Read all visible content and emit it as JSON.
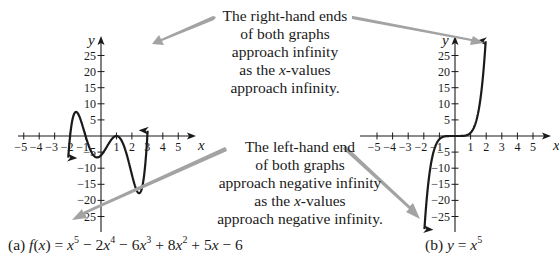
{
  "annotations": {
    "top": {
      "lines": [
        "The right-hand ends",
        "of both graphs",
        "approach infinity",
        "as the |x|-values",
        "approach infinity."
      ]
    },
    "bottom": {
      "lines": [
        "The left-hand end",
        "of both graphs",
        "approach negative infinity",
        "as the |x|-values",
        "approach negative infinity."
      ]
    }
  },
  "captions": {
    "a": {
      "label": "(a)",
      "func": "f(x) = x^5 − 2x^4 − 6x^3 + 8x^2 + 5x − 6"
    },
    "b": {
      "label": "(b)",
      "func": "y = x^5"
    }
  },
  "colors": {
    "curve": "#1a1a1a",
    "axis": "#1a1a1a",
    "arrow": "#a0a0a0",
    "text": "#1a1a1a"
  },
  "graphs": [
    {
      "id": "a",
      "x_label": "x",
      "y_label": "y",
      "x_ticks": [
        -5,
        -4,
        -3,
        -2,
        -1,
        1,
        2,
        3,
        4,
        5
      ],
      "y_ticks": [
        25,
        20,
        15,
        10,
        5,
        -5,
        -10,
        -15,
        -20,
        -25
      ],
      "coefficients": [
        1,
        -2,
        -6,
        8,
        5,
        -6
      ],
      "x_domain": [
        -2.12,
        3.02
      ],
      "y_clip": [
        -29,
        30.5
      ]
    },
    {
      "id": "b",
      "x_label": "x",
      "y_label": "y",
      "x_ticks": [
        -5,
        -4,
        -3,
        -2,
        -1,
        1,
        2,
        3,
        4,
        5
      ],
      "y_ticks": [
        25,
        20,
        15,
        10,
        5,
        -5,
        -10,
        -15,
        -20,
        -25
      ],
      "coefficients": [
        1,
        0,
        0,
        0,
        0,
        0
      ],
      "x_domain": [
        -2.0,
        2.0
      ],
      "y_clip": [
        -29,
        29.5
      ]
    }
  ],
  "chart_data": [
    {
      "type": "line",
      "title": "(a) f(x) = x^5 − 2x^4 − 6x^3 + 8x^2 + 5x − 6",
      "xlabel": "x",
      "ylabel": "y",
      "xlim": [
        -5,
        5
      ],
      "ylim": [
        -25,
        25
      ],
      "x_ticks": [
        -5,
        -4,
        -3,
        -2,
        -1,
        1,
        2,
        3,
        4,
        5
      ],
      "y_ticks": [
        -25,
        -20,
        -15,
        -10,
        -5,
        5,
        10,
        15,
        20,
        25
      ],
      "key_points": [
        {
          "x": -2,
          "y": 0
        },
        {
          "x": -1.6,
          "y": 7.2
        },
        {
          "x": -1,
          "y": 0
        },
        {
          "x": -0.25,
          "y": -6.6
        },
        {
          "x": 1,
          "y": 0
        },
        {
          "x": 2.5,
          "y": -17.6
        },
        {
          "x": 3,
          "y": 0
        }
      ],
      "end_behavior": {
        "left": "-infinity",
        "right": "+infinity"
      }
    },
    {
      "type": "line",
      "title": "(b) y = x^5",
      "xlabel": "x",
      "ylabel": "y",
      "xlim": [
        -5,
        5
      ],
      "ylim": [
        -25,
        25
      ],
      "x_ticks": [
        -5,
        -4,
        -3,
        -2,
        -1,
        1,
        2,
        3,
        4,
        5
      ],
      "y_ticks": [
        -25,
        -20,
        -15,
        -10,
        -5,
        5,
        10,
        15,
        20,
        25
      ],
      "key_points": [
        {
          "x": -1,
          "y": -1
        },
        {
          "x": 0,
          "y": 0
        },
        {
          "x": 1,
          "y": 1
        }
      ],
      "end_behavior": {
        "left": "-infinity",
        "right": "+infinity"
      }
    }
  ]
}
